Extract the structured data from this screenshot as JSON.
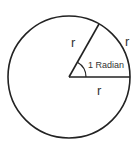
{
  "diagram": {
    "circle": {
      "cx": 69,
      "cy": 77,
      "r": 61,
      "stroke": "#222222"
    },
    "radius_horizontal": {
      "x1": 69,
      "y1": 77,
      "x2": 130,
      "y2": 77
    },
    "radius_slanted": {
      "x1": 69,
      "y1": 77,
      "x2": 99,
      "y2": 24
    },
    "angle_label": "1 Radian",
    "labels": {
      "slanted_radius": "r",
      "arc_length": "r",
      "horizontal_radius": "r"
    },
    "colors": {
      "stroke": "#222222",
      "text": "#333333",
      "background": "#ffffff"
    }
  }
}
